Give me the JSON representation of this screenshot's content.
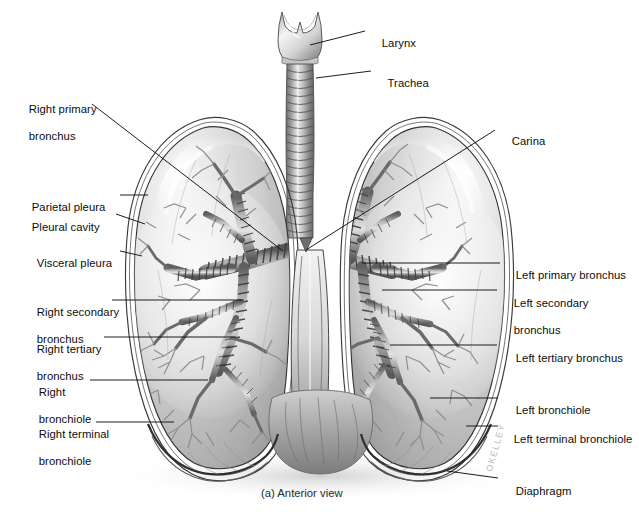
{
  "figure": {
    "caption": "(a) Anterior view",
    "artist_signature": "OKELLEY",
    "view": "Anterior view",
    "background_color": "#ffffff",
    "leader_line_color": "#111111",
    "label_text_color": "#0d0d0d"
  },
  "labels_left": [
    {
      "id": "right-primary-bronchus",
      "line1": "Right primary",
      "line2": "bronchus"
    },
    {
      "id": "parietal-pleura",
      "line1": "Parietal pleura",
      "line2": ""
    },
    {
      "id": "pleural-cavity",
      "line1": "Pleural cavity",
      "line2": ""
    },
    {
      "id": "visceral-pleura",
      "line1": "Visceral pleura",
      "line2": ""
    },
    {
      "id": "right-secondary-bronchus",
      "line1": "Right secondary",
      "line2": "bronchus"
    },
    {
      "id": "right-tertiary-bronchus",
      "line1": "Right tertiary",
      "line2": "bronchus"
    },
    {
      "id": "right-bronchiole",
      "line1": "Right",
      "line2": "bronchiole"
    },
    {
      "id": "right-terminal-bronchiole",
      "line1": "Right terminal",
      "line2": "bronchiole"
    }
  ],
  "labels_right": [
    {
      "id": "larynx",
      "line1": "Larynx",
      "line2": ""
    },
    {
      "id": "trachea",
      "line1": "Trachea",
      "line2": ""
    },
    {
      "id": "carina",
      "line1": "Carina",
      "line2": ""
    },
    {
      "id": "left-primary-bronchus",
      "line1": "Left primary bronchus",
      "line2": ""
    },
    {
      "id": "left-secondary-bronchus",
      "line1": "Left secondary",
      "line2": "bronchus"
    },
    {
      "id": "left-tertiary-bronchus",
      "line1": "Left tertiary bronchus",
      "line2": ""
    },
    {
      "id": "left-bronchiole",
      "line1": "Left bronchiole",
      "line2": ""
    },
    {
      "id": "left-terminal-bronchiole",
      "line1": "Left terminal bronchiole",
      "line2": ""
    },
    {
      "id": "diaphragm",
      "line1": "Diaphragm",
      "line2": ""
    }
  ]
}
